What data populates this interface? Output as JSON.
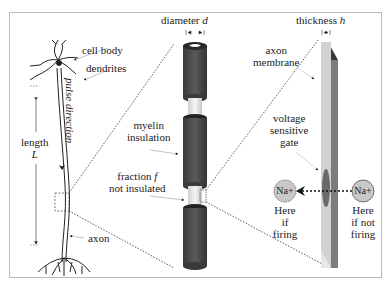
{
  "labels": {
    "cell_body": "cell body",
    "dendrites": "dendrites",
    "pulse_direction": "pulse direction",
    "length": "length",
    "length_var": "L",
    "axon": "axon",
    "diameter": "diameter",
    "diameter_var": "d",
    "myelin_1": "myelin",
    "myelin_2": "insulation",
    "fraction_1": "fraction",
    "fraction_var": "f",
    "fraction_2": "not insulated",
    "thickness": "thickness",
    "thickness_var": "h",
    "membrane_1": "axon",
    "membrane_2": "membrane",
    "gate_1": "voltage",
    "gate_2": "sensitive",
    "gate_3": "gate",
    "ion_left": "Na+",
    "ion_right": "Na+",
    "left_caption_1": "Here",
    "left_caption_2": "if",
    "left_caption_3": "firing",
    "right_caption_1": "Here",
    "right_caption_2": "if not",
    "right_caption_3": "firing"
  },
  "colors": {
    "myelin": "#4a4a4a",
    "node": "#e8e8e8",
    "membrane_face": "#d0d0d0",
    "membrane_side": "#7a7a7a",
    "gate": "#6e6e6e",
    "ion": "#c8c8c8",
    "line": "#222222"
  }
}
